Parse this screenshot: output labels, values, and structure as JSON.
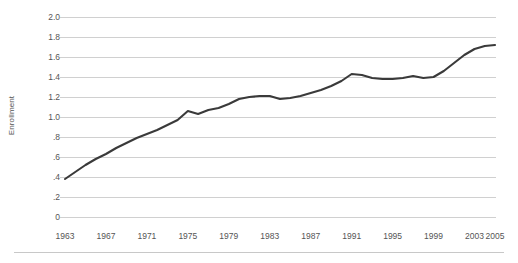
{
  "chart_data": {
    "type": "line",
    "title": "",
    "xlabel": "",
    "ylabel": "Enrollment",
    "ylim": [
      0,
      2.0
    ],
    "xlim": [
      1963,
      2005
    ],
    "grid": true,
    "legend": "none",
    "y_ticks": [
      "0",
      ".2",
      ".4",
      ".6",
      ".8",
      "1.0",
      "1.2",
      "1.4",
      "1.6",
      "1.8",
      "2.0"
    ],
    "y_tick_values": [
      0,
      0.2,
      0.4,
      0.6,
      0.8,
      1.0,
      1.2,
      1.4,
      1.6,
      1.8,
      2.0
    ],
    "x_ticks": [
      "1963",
      "1967",
      "1971",
      "1975",
      "1979",
      "1983",
      "1987",
      "1991",
      "1995",
      "1999",
      "2003",
      "2005"
    ],
    "x_tick_values": [
      1963,
      1967,
      1971,
      1975,
      1979,
      1983,
      1987,
      1991,
      1995,
      1999,
      2003,
      2005
    ],
    "series": [
      {
        "name": "Enrollment",
        "color": "#3a3a3a",
        "x": [
          1963,
          1964,
          1965,
          1966,
          1967,
          1968,
          1969,
          1970,
          1971,
          1972,
          1973,
          1974,
          1975,
          1976,
          1977,
          1978,
          1979,
          1980,
          1981,
          1982,
          1983,
          1984,
          1985,
          1986,
          1987,
          1988,
          1989,
          1990,
          1991,
          1992,
          1993,
          1994,
          1995,
          1996,
          1997,
          1998,
          1999,
          2000,
          2001,
          2002,
          2003,
          2004,
          2005
        ],
        "values": [
          0.38,
          0.45,
          0.52,
          0.58,
          0.63,
          0.69,
          0.74,
          0.79,
          0.83,
          0.87,
          0.92,
          0.97,
          1.06,
          1.03,
          1.07,
          1.09,
          1.13,
          1.18,
          1.2,
          1.21,
          1.21,
          1.18,
          1.19,
          1.21,
          1.24,
          1.27,
          1.31,
          1.36,
          1.43,
          1.42,
          1.39,
          1.38,
          1.38,
          1.39,
          1.41,
          1.39,
          1.4,
          1.46,
          1.54,
          1.62,
          1.68,
          1.71,
          1.72
        ]
      }
    ]
  }
}
